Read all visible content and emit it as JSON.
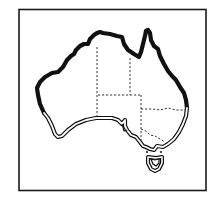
{
  "figure": {
    "type": "distribution-map",
    "region": "Australia",
    "frame_color": "#1a1a1a",
    "line_color": "#111111",
    "background": "#ffffff"
  },
  "legend_encoding": {
    "thick_black_coastline": "northern coastline from western Australia around to eastern Queensland",
    "double_line_coastline": "southern coastline from south-west Western Australia to New South Wales, including Tasmania",
    "dashed_lines": "state and territory borders"
  },
  "caption": ""
}
